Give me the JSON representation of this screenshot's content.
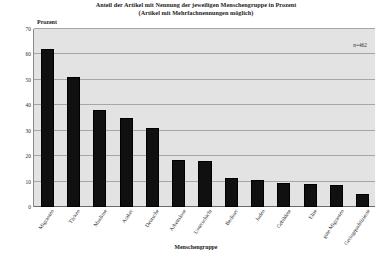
{
  "chart_data": {
    "type": "bar",
    "title": "Anteil der Artikel mit Nennung der jeweiligen Menschengruppe in Prozent",
    "subtitle": "(Artikel mit Mehrfachnennungen möglich)",
    "xlabel": "Menschengruppe",
    "ylabel": "Prozent",
    "ylim": [
      0,
      70
    ],
    "yticks": [
      0,
      10,
      20,
      30,
      40,
      50,
      60,
      70
    ],
    "ytick_labels": [
      "0",
      "10",
      "20",
      "30",
      "40",
      "50",
      "60",
      "70"
    ],
    "grid": "horizontal",
    "legend": "none",
    "annotation": "n=462",
    "categories": [
      "Migranten",
      "Türken",
      "Muslime",
      "Araber",
      "Deutsche",
      "Arbeitslose",
      "Unterschicht",
      "Berliner",
      "Juden",
      "Gebildete",
      "Elite",
      "gute Migranten",
      "Geringqualifizierte"
    ],
    "values": [
      62,
      51,
      38,
      35,
      31,
      18.5,
      18,
      11.5,
      10.5,
      9.5,
      9,
      8.5,
      5
    ],
    "bar_color": "#101010",
    "plot_background": "#e3e3e3",
    "gridline_color": "#a6a6a6"
  }
}
